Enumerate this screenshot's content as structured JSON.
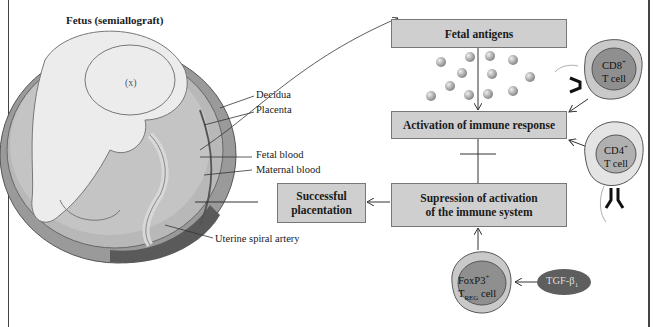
{
  "title": "Fetus (semiallograft)",
  "anatomy_labels": {
    "decidua": "Decidua",
    "placenta": "Placenta",
    "fetal_blood": "Fetal blood",
    "maternal_blood": "Maternal blood",
    "uterine_spiral_artery": "Uterine spiral artery"
  },
  "boxes": {
    "fetal_antigens": "Fetal antigens",
    "activation": "Activation of immune response",
    "suppression_line1": "Supression of activation",
    "suppression_line2": "of the immune system",
    "placentation_line1": "Successful",
    "placentation_line2": "placentation"
  },
  "cells": {
    "cd8": {
      "name": "CD8",
      "sup": "+",
      "line2": "T cell"
    },
    "cd4": {
      "name": "CD4",
      "sup": "+",
      "line2": "T cell"
    },
    "treg": {
      "name": "FoxP3",
      "sup": "+",
      "line2_main": "T",
      "line2_sub": "REG",
      "line2_rest": " cell"
    },
    "tgf": {
      "name": "TGF-β",
      "sub": "1"
    }
  },
  "colors": {
    "box_fill": "#cfcfcf",
    "cell_outer": "#c9c9c9",
    "cell_inner": "#8f8f8f",
    "tgf_fill": "#5e5e5e",
    "antigen": "#a8a8a8"
  }
}
